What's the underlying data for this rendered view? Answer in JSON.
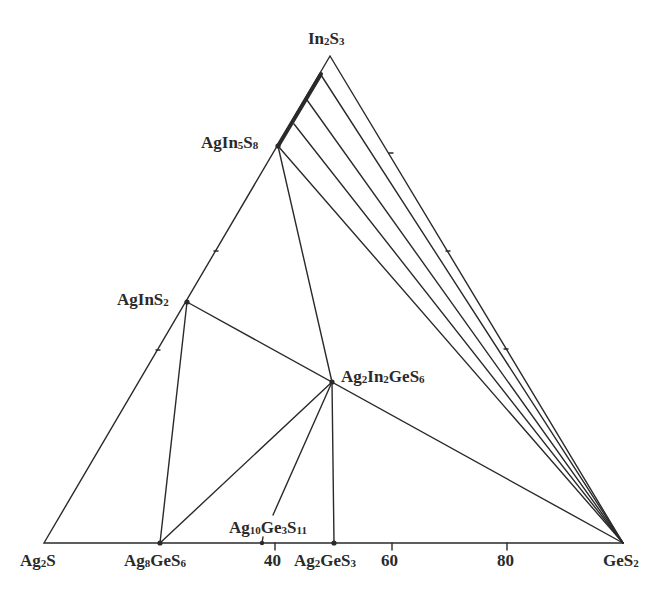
{
  "diagram": {
    "type": "ternary-phase-diagram",
    "system": "Ag2S–In2S3–GeS2",
    "line_color": "#2a2a2a",
    "vertices": {
      "top": {
        "label": "In2S3",
        "parts": [
          [
            "In",
            ""
          ],
          [
            "",
            "2"
          ],
          [
            "S",
            ""
          ],
          [
            "",
            "3"
          ]
        ]
      },
      "bottom_left": {
        "label": "Ag2S",
        "parts": [
          [
            "Ag",
            ""
          ],
          [
            "",
            "2"
          ],
          [
            "S",
            ""
          ]
        ]
      },
      "bottom_right": {
        "label": "GeS2",
        "parts": [
          [
            "GeS",
            ""
          ],
          [
            "",
            "2"
          ]
        ]
      }
    },
    "base_axis_ticks": [
      {
        "value": "40",
        "label": "40"
      },
      {
        "value": "60",
        "label": "60"
      },
      {
        "value": "80",
        "label": "80"
      }
    ],
    "compounds": [
      {
        "id": "AgIn5S8",
        "label": "AgIn5S8",
        "parts": [
          [
            "AgIn",
            ""
          ],
          [
            "",
            "5"
          ],
          [
            "S",
            ""
          ],
          [
            "",
            "8"
          ]
        ]
      },
      {
        "id": "AgInS2",
        "label": "AgInS2",
        "parts": [
          [
            "AgInS",
            ""
          ],
          [
            "",
            "2"
          ]
        ]
      },
      {
        "id": "Ag2In2GeS6",
        "label": "Ag2In2GeS6",
        "parts": [
          [
            "Ag",
            ""
          ],
          [
            "",
            "2"
          ],
          [
            "In",
            ""
          ],
          [
            "",
            "2"
          ],
          [
            "GeS",
            ""
          ],
          [
            "",
            "6"
          ]
        ]
      },
      {
        "id": "Ag8GeS6",
        "label": "Ag8GeS6",
        "parts": [
          [
            "Ag",
            ""
          ],
          [
            "",
            "8"
          ],
          [
            "GeS",
            ""
          ],
          [
            "",
            "6"
          ]
        ]
      },
      {
        "id": "Ag10Ge3S11",
        "label": "Ag10Ge3S11",
        "parts": [
          [
            "Ag",
            ""
          ],
          [
            "",
            "10"
          ],
          [
            "Ge",
            ""
          ],
          [
            "",
            "3"
          ],
          [
            "S",
            ""
          ],
          [
            "",
            "11"
          ]
        ]
      },
      {
        "id": "Ag2GeS3",
        "label": "Ag2GeS3",
        "parts": [
          [
            "Ag",
            ""
          ],
          [
            "",
            "2"
          ],
          [
            "GeS",
            ""
          ],
          [
            "",
            "3"
          ]
        ]
      }
    ],
    "tie_lines": [
      [
        "AgInS2",
        "GeS2"
      ],
      [
        "AgInS2",
        "Ag8GeS6"
      ],
      [
        "AgIn5S8",
        "Ag2In2GeS6"
      ],
      [
        "AgIn5S8",
        "GeS2"
      ],
      [
        "Ag2In2GeS6",
        "Ag8GeS6"
      ],
      [
        "Ag2In2GeS6",
        "Ag10Ge3S11"
      ],
      [
        "Ag2In2GeS6",
        "Ag2GeS3"
      ],
      [
        "In2S3-AgIn5S8 solid solution",
        "GeS2"
      ]
    ],
    "solid_solution": "In2S3–AgIn5S8 region (thick line along edge)"
  }
}
